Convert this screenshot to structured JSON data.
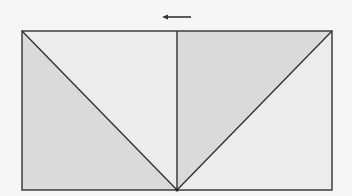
{
  "diagram": {
    "width": 352,
    "height": 196,
    "background": "#f6f6f6",
    "stroke_color": "#333333",
    "stroke_width": 1.4,
    "rectangle": {
      "x1": 22,
      "y1": 31,
      "x2": 332,
      "y2": 190
    },
    "apex": {
      "x": 177,
      "y": 190
    },
    "arrow": {
      "direction": "left",
      "x_start": 191,
      "x_end": 163,
      "y": 17,
      "color": "#333333"
    },
    "regions": [
      {
        "name": "left-lower-triangle",
        "fill": "#dadada",
        "points": "22,31 22,190 177,190"
      },
      {
        "name": "left-upper-triangle",
        "fill": "#ececec",
        "points": "22,31 177,31 177,190"
      },
      {
        "name": "right-upper-triangle",
        "fill": "#dadada",
        "points": "177,31 332,31 177,190"
      },
      {
        "name": "right-lower-triangle",
        "fill": "#ececec",
        "points": "332,31 332,190 177,190"
      }
    ],
    "lines": [
      {
        "name": "left-diagonal",
        "x1": 22,
        "y1": 31,
        "x2": 177,
        "y2": 190
      },
      {
        "name": "center-vertical",
        "x1": 177,
        "y1": 31,
        "x2": 177,
        "y2": 190
      },
      {
        "name": "right-diagonal",
        "x1": 332,
        "y1": 31,
        "x2": 177,
        "y2": 190
      }
    ]
  }
}
